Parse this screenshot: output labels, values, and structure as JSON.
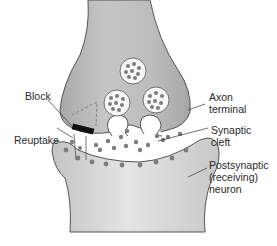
{
  "diagram": {
    "type": "synapse-illustration",
    "labels": {
      "block": "Block",
      "axon_terminal_line1": "Axon",
      "axon_terminal_line2": "terminal",
      "reuptake": "Reuptake",
      "synaptic_cleft_line1": "Synaptic",
      "synaptic_cleft_line2": "cleft",
      "postsynaptic_line1": "Postsynaptic",
      "postsynaptic_line2": "(receiving)",
      "postsynaptic_line3": "neuron"
    },
    "colors": {
      "neuron_fill": "#b9b9b9",
      "neuron_light": "#d6d6d6",
      "outline": "#555555",
      "vesicle_fill": "#f7f7f7",
      "neurotransmitter": "#7d7d7d",
      "block_bar": "#111111",
      "background": "#ffffff"
    },
    "vesicles": [
      {
        "name": "vesicle-top",
        "cx": 133,
        "cy": 71,
        "r": 13
      },
      {
        "name": "vesicle-left",
        "cx": 117,
        "cy": 103,
        "r": 13
      },
      {
        "name": "vesicle-right",
        "cx": 156,
        "cy": 100,
        "r": 13
      }
    ]
  }
}
